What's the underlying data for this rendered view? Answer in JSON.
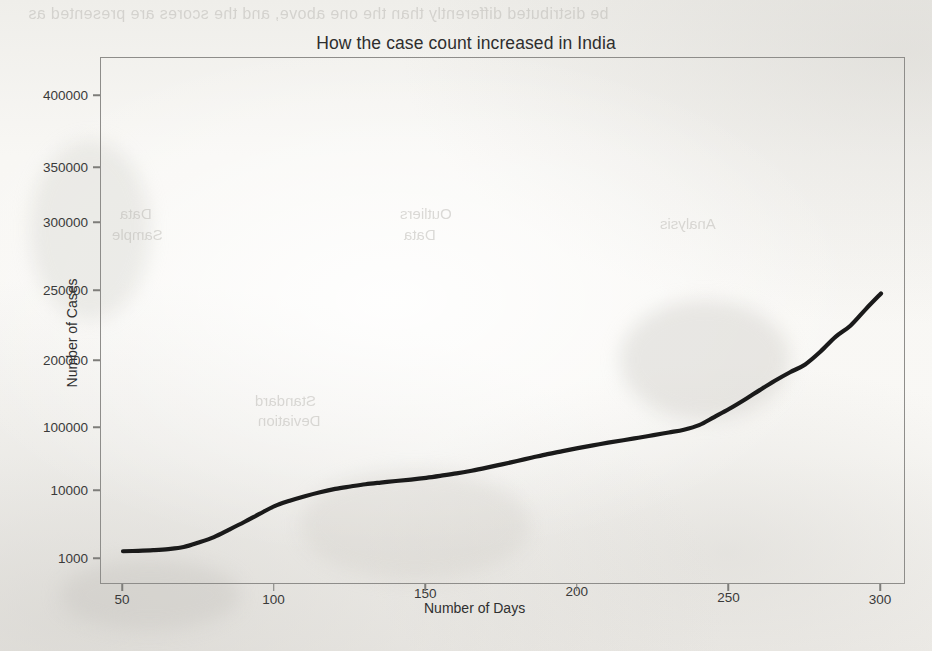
{
  "figure": {
    "kind": "line-chart",
    "paper_color": "#f7f6f3",
    "ink_color": "#1a1a1a",
    "axis_color": "#8e8d8a"
  },
  "chart_data": {
    "type": "line",
    "title": "How the case count increased in India",
    "xlabel": "Number of Days",
    "ylabel": "Number of Cases",
    "grid": false,
    "legend": null,
    "xlim": [
      45,
      305
    ],
    "ylim": [
      700,
      430000
    ],
    "y_scale": "custom-nonuniform",
    "xticks": [
      50,
      100,
      150,
      200,
      250,
      300
    ],
    "xtick_labels": [
      "50",
      "100",
      "150",
      "200",
      "250",
      "300"
    ],
    "yticks": [
      1000,
      10000,
      100000,
      200000,
      250000,
      300000,
      350000,
      400000
    ],
    "ytick_labels": [
      "1000",
      "10000",
      "100000",
      "200000",
      "250000",
      "300000",
      "350000",
      "400000"
    ],
    "series": [
      {
        "name": "Cumulative cases (India)",
        "color": "#1a1a1a",
        "x": [
          50,
          55,
          60,
          65,
          70,
          75,
          80,
          85,
          90,
          95,
          100,
          105,
          110,
          115,
          120,
          125,
          130,
          135,
          140,
          145,
          150,
          155,
          160,
          165,
          170,
          175,
          180,
          185,
          190,
          195,
          200,
          205,
          210,
          215,
          220,
          225,
          230,
          235,
          240,
          245,
          250,
          255,
          260,
          265,
          270,
          275,
          280,
          285,
          290,
          295,
          300
        ],
        "values": [
          1300,
          1320,
          1350,
          1400,
          1500,
          1750,
          2100,
          2700,
          3500,
          4600,
          6000,
          7200,
          8400,
          9600,
          10800,
          11800,
          12800,
          13600,
          14400,
          15200,
          16200,
          17500,
          19000,
          21000,
          23500,
          26500,
          30000,
          34000,
          38500,
          43000,
          48000,
          53000,
          58500,
          64000,
          70000,
          77000,
          85000,
          94000,
          103000,
          112000,
          122000,
          134000,
          148000,
          163000,
          178000,
          193000,
          206000,
          216000,
          224000,
          236000,
          248000
        ]
      }
    ]
  },
  "ghost_text": {
    "line_top": "be distributed differently than the one above, and the scores are presented as",
    "blob_a": "Data",
    "blob_b": "Sample",
    "blob_c": "Outliers",
    "blob_d": "Data",
    "blob_e": "Analysis",
    "blob_f": "Standard",
    "blob_g": "Deviation"
  }
}
